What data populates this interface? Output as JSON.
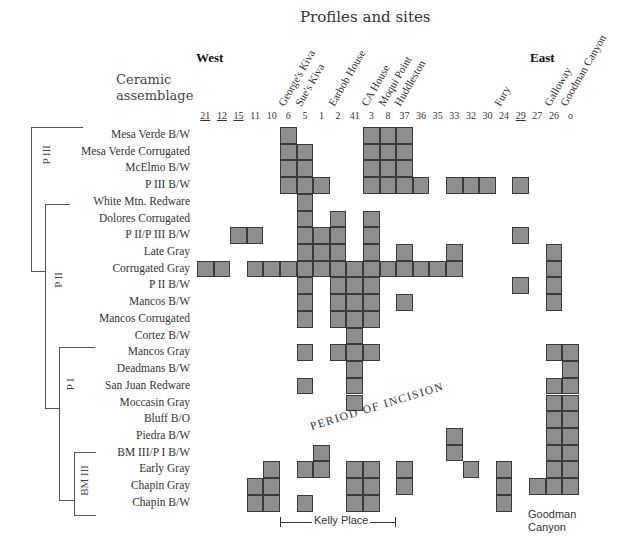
{
  "header": {
    "title": "Profiles and sites",
    "west": "West",
    "east": "East",
    "axis_label_line1": "Ceramic",
    "axis_label_line2": "assemblage"
  },
  "columns": [
    {
      "id": "21",
      "underline": true
    },
    {
      "id": "12",
      "underline": true
    },
    {
      "id": "15",
      "underline": true
    },
    {
      "id": "11",
      "underline": false
    },
    {
      "id": "10",
      "underline": false
    },
    {
      "id": "6",
      "underline": false
    },
    {
      "id": "5",
      "underline": false
    },
    {
      "id": "1",
      "underline": false
    },
    {
      "id": "2",
      "underline": false
    },
    {
      "id": "41",
      "underline": false
    },
    {
      "id": "3",
      "underline": false
    },
    {
      "id": "8",
      "underline": false
    },
    {
      "id": "37",
      "underline": false
    },
    {
      "id": "36",
      "underline": false
    },
    {
      "id": "35",
      "underline": false
    },
    {
      "id": "33",
      "underline": false
    },
    {
      "id": "32",
      "underline": false
    },
    {
      "id": "30",
      "underline": false
    },
    {
      "id": "24",
      "underline": false
    },
    {
      "id": "29",
      "underline": true
    },
    {
      "id": "27",
      "underline": false
    },
    {
      "id": "26",
      "underline": false
    },
    {
      "id": "o",
      "underline": false
    }
  ],
  "sites": [
    {
      "name": "George's Kiva",
      "col": 5
    },
    {
      "name": "Sue's Kiva",
      "col": 6
    },
    {
      "name": "Earbob House",
      "col": 8
    },
    {
      "name": "CA House",
      "col": 10
    },
    {
      "name": "Moqui Point",
      "col": 11
    },
    {
      "name": "Huddleston",
      "col": 12
    },
    {
      "name": "Fury",
      "col": 18
    },
    {
      "name": "Galloway",
      "col": 21
    },
    {
      "name": "Goodman Canyon",
      "col": 22
    }
  ],
  "rows": [
    {
      "label": "Mesa Verde B/W",
      "cols": [
        "6",
        "3",
        "8",
        "37"
      ]
    },
    {
      "label": "Mesa Verde Corrugated",
      "cols": [
        "6",
        "5",
        "3",
        "8",
        "37"
      ]
    },
    {
      "label": "McElmo B/W",
      "cols": [
        "6",
        "5",
        "3",
        "8",
        "37"
      ]
    },
    {
      "label": "P III B/W",
      "cols": [
        "6",
        "5",
        "1",
        "3",
        "8",
        "37",
        "36",
        "33",
        "32",
        "30",
        "29"
      ]
    },
    {
      "label": "White Mtn. Redware",
      "cols": [
        "5"
      ]
    },
    {
      "label": "Dolores Corrugated",
      "cols": [
        "5",
        "2",
        "3"
      ]
    },
    {
      "label": "P II/P III B/W",
      "cols": [
        "15",
        "11",
        "5",
        "1",
        "2",
        "3",
        "29"
      ]
    },
    {
      "label": "Late Gray",
      "cols": [
        "5",
        "1",
        "2",
        "3",
        "37",
        "33",
        "26"
      ]
    },
    {
      "label": "Corrugated Gray",
      "cols": [
        "21",
        "12",
        "11",
        "10",
        "6",
        "5",
        "1",
        "2",
        "41",
        "3",
        "8",
        "37",
        "36",
        "35",
        "33",
        "26"
      ]
    },
    {
      "label": "P II B/W",
      "cols": [
        "5",
        "2",
        "41",
        "3",
        "29",
        "26"
      ]
    },
    {
      "label": "Mancos B/W",
      "cols": [
        "5",
        "2",
        "41",
        "3",
        "37",
        "26"
      ]
    },
    {
      "label": "Mancos Corrugated",
      "cols": [
        "5",
        "2",
        "41",
        "3"
      ]
    },
    {
      "label": "Cortez B/W",
      "cols": [
        "41"
      ]
    },
    {
      "label": "Mancos Gray",
      "cols": [
        "5",
        "2",
        "41",
        "3",
        "26",
        "o"
      ]
    },
    {
      "label": "Deadmans B/W",
      "cols": [
        "41",
        "o"
      ]
    },
    {
      "label": "San Juan Redware",
      "cols": [
        "5",
        "41",
        "26",
        "o"
      ]
    },
    {
      "label": "Moccasin Gray",
      "cols": [
        "41",
        "26",
        "o"
      ]
    },
    {
      "label": "Bluff B/O",
      "cols": [
        "26",
        "o"
      ]
    },
    {
      "label": "Piedra B/W",
      "cols": [
        "33",
        "26",
        "o"
      ]
    },
    {
      "label": "BM III/P I B/W",
      "cols": [
        "1",
        "33",
        "26",
        "o"
      ]
    },
    {
      "label": "Early Gray",
      "cols": [
        "10",
        "5",
        "1",
        "41",
        "3",
        "37",
        "32",
        "24",
        "26",
        "o"
      ]
    },
    {
      "label": "Chapin Gray",
      "cols": [
        "11",
        "10",
        "41",
        "3",
        "37",
        "24",
        "27",
        "26",
        "o"
      ]
    },
    {
      "label": "Chapin B/W",
      "cols": [
        "11",
        "10",
        "5",
        "41",
        "3",
        "24"
      ]
    }
  ],
  "periods": [
    {
      "label": "P III",
      "from_row": 0,
      "to_row": 8
    },
    {
      "label": "P II",
      "from_row": 4,
      "to_row": 16
    },
    {
      "label": "P I",
      "from_row": 13,
      "to_row": 21
    },
    {
      "label": "BM III",
      "from_row": 19,
      "to_row": 22
    }
  ],
  "annotations": {
    "incision": "PERIOD OF INCISION",
    "kelly_place": "Kelly Place",
    "goodman_line1": "Goodman",
    "goodman_line2": "Canyon"
  },
  "colors": {
    "cell_fill": "#8e8e8e",
    "cell_border": "#3a3a3a"
  }
}
